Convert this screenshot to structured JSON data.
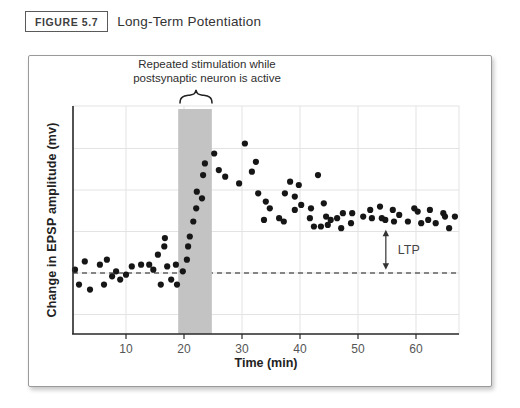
{
  "header": {
    "figure_label": "FIGURE 5.7",
    "title": "Long-Term Potentiation"
  },
  "colors": {
    "dot": "#161616",
    "stimulation_band": "#c3c3c3",
    "grid": "#e3e3e3",
    "axis": "#2b2b2b",
    "baseline": "#1a1a1a",
    "tick_text": "#555555",
    "annotation_text": "#2e2e2e",
    "ltp_text": "#444444"
  },
  "chart_data": {
    "type": "scatter",
    "title": "Long-Term Potentiation",
    "xlabel": "Time (min)",
    "ylabel": "Change in EPSP amplitude (mv)",
    "x_ticks": [
      10,
      20,
      30,
      40,
      50,
      60
    ],
    "xlim": [
      1,
      67.5
    ],
    "ylim": [
      -37,
      100
    ],
    "y_unit": "relative change, baseline = 0 (no numeric y ticks shown)",
    "y_gridlines": [
      -25,
      0,
      25,
      50,
      75
    ],
    "grid": true,
    "baseline": {
      "amp": 0,
      "style": "dashed"
    },
    "stimulation_window": {
      "t_start": 19,
      "t_end": 24.8,
      "label_line1": "Repeated stimulation while",
      "label_line2": "postsynaptic neuron is active"
    },
    "ltp_annotation": {
      "t": 54.8,
      "amp_top": 26,
      "amp_bottom": 2,
      "label": "LTP"
    },
    "points": [
      [
        1.2,
        2
      ],
      [
        1.9,
        -7
      ],
      [
        2.9,
        7
      ],
      [
        3.8,
        -10
      ],
      [
        5.5,
        5
      ],
      [
        6.2,
        -7
      ],
      [
        6.7,
        8
      ],
      [
        7.6,
        -2
      ],
      [
        8.3,
        1
      ],
      [
        9.0,
        -4
      ],
      [
        10.0,
        -1
      ],
      [
        11.0,
        4
      ],
      [
        12.6,
        5
      ],
      [
        14.0,
        5
      ],
      [
        14.7,
        2
      ],
      [
        15.5,
        11
      ],
      [
        16.0,
        -7
      ],
      [
        16.6,
        16
      ],
      [
        16.7,
        21
      ],
      [
        17.1,
        4
      ],
      [
        17.8,
        -4
      ],
      [
        18.6,
        5
      ],
      [
        18.8,
        -7
      ],
      [
        19.8,
        1
      ],
      [
        20.5,
        8
      ],
      [
        20.7,
        16
      ],
      [
        21.0,
        22
      ],
      [
        21.6,
        31
      ],
      [
        22.1,
        39
      ],
      [
        22.2,
        49
      ],
      [
        23.1,
        45
      ],
      [
        23.3,
        59
      ],
      [
        23.6,
        66
      ],
      [
        25.2,
        72
      ],
      [
        26.0,
        62
      ],
      [
        27.1,
        58
      ],
      [
        29.5,
        54
      ],
      [
        30.5,
        78
      ],
      [
        31.7,
        61
      ],
      [
        32.4,
        67
      ],
      [
        32.8,
        48
      ],
      [
        33.8,
        32
      ],
      [
        34.1,
        43
      ],
      [
        34.8,
        39
      ],
      [
        36.4,
        33
      ],
      [
        37.2,
        31
      ],
      [
        37.4,
        48
      ],
      [
        38.3,
        55
      ],
      [
        39.1,
        46
      ],
      [
        39.1,
        38
      ],
      [
        39.8,
        53
      ],
      [
        40.2,
        41
      ],
      [
        41.7,
        33
      ],
      [
        41.9,
        39
      ],
      [
        42.4,
        28
      ],
      [
        43.1,
        59
      ],
      [
        43.6,
        28
      ],
      [
        44.1,
        42
      ],
      [
        44.5,
        34
      ],
      [
        44.8,
        29
      ],
      [
        45.3,
        32
      ],
      [
        46.4,
        33
      ],
      [
        47.1,
        27
      ],
      [
        47.4,
        36
      ],
      [
        48.8,
        30
      ],
      [
        49.0,
        36
      ],
      [
        50.9,
        34
      ],
      [
        52.1,
        38
      ],
      [
        52.4,
        33
      ],
      [
        53.8,
        40
      ],
      [
        54.1,
        33
      ],
      [
        54.7,
        32
      ],
      [
        56.0,
        38
      ],
      [
        56.2,
        31
      ],
      [
        57.1,
        35
      ],
      [
        58.6,
        31
      ],
      [
        59.7,
        39
      ],
      [
        60.3,
        37
      ],
      [
        60.9,
        30
      ],
      [
        62.1,
        32
      ],
      [
        62.4,
        38
      ],
      [
        63.4,
        30
      ],
      [
        64.7,
        36
      ],
      [
        65.0,
        34
      ],
      [
        65.7,
        27
      ],
      [
        66.7,
        34
      ]
    ]
  }
}
